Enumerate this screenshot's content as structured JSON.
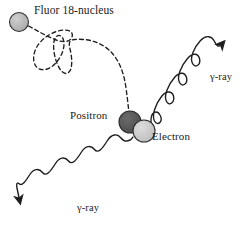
{
  "figure": {
    "background_color": "#ffffff",
    "width": 251,
    "height": 237
  },
  "labels": {
    "nucleus": "Fluor 18-nucleus",
    "positron": "Positron",
    "electron": "Electron",
    "gamma_upper": "γ-ray",
    "gamma_lower": "γ-ray"
  },
  "particles": {
    "nucleus": {
      "name": "Fluor 18-nucleus",
      "fill": "#b4b4b4",
      "stroke": "#333333",
      "cx": 19,
      "cy": 22,
      "r": 9.5
    },
    "positron": {
      "name": "Positron",
      "fill": "#575757",
      "stroke": "#2b2b2b",
      "cx": 130,
      "cy": 122,
      "r": 11
    },
    "electron": {
      "name": "Electron",
      "fill": "#c9c9c9",
      "stroke": "#2b2b2b",
      "cx": 144,
      "cy": 131,
      "r": 11
    }
  },
  "tracks": {
    "positron_path": {
      "name": "positron-track",
      "style": "dashed",
      "stroke": "#1f1f1f",
      "dash": "4,3",
      "width": 1.3
    },
    "gamma_upper": {
      "name": "gamma-ray-upper",
      "style": "sine-wave",
      "stroke": "#1f1f1f",
      "width": 1.4,
      "direction": "up-right"
    },
    "gamma_lower": {
      "name": "gamma-ray-lower",
      "style": "sine-wave",
      "stroke": "#1f1f1f",
      "width": 1.4,
      "direction": "down-left"
    }
  },
  "colors": {
    "ink": "#1f1f1f",
    "nucleus_gray": "#b4b4b4",
    "positron_gray": "#575757",
    "electron_gray": "#c9c9c9"
  }
}
